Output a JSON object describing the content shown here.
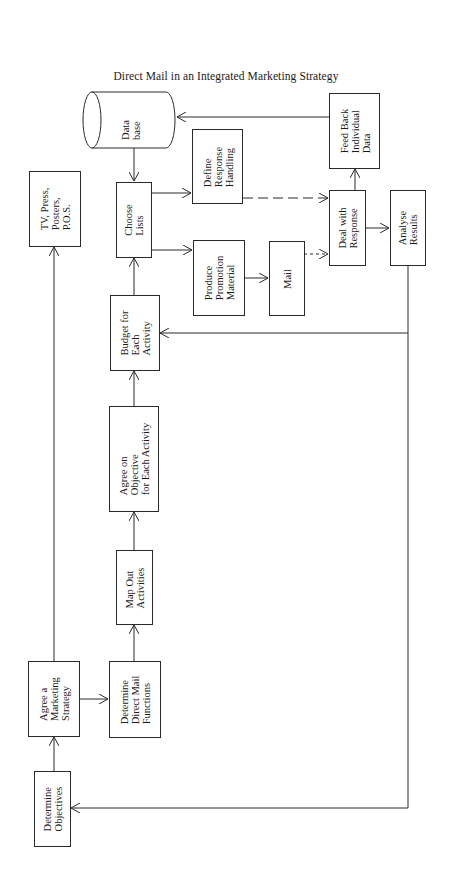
{
  "title": "Direct Mail in an Integrated Marketing Strategy",
  "nodes": {
    "database": "Data\nbase",
    "feed_back": "Feed Back\nIndividual\nData",
    "define_response": "Define\nResponse\nHandling",
    "choose_lists": "Choose\nLists",
    "tv_press": "TV, Press,\nPosters,\nP.O.S.",
    "deal_with_response": "Deal with\nResponse",
    "analyse_results": "Analyse\nResults",
    "produce_promotion": "Produce\nPromotion\nMaterial",
    "mail": "Mail",
    "budget": "Budget for\nEach\nActivity",
    "agree_objective": "Agree on\nObjective\nfor Each Activity",
    "map_out": "Map Out\nActivities",
    "agree_strategy": "Agree a\nMarketing\nStrategy",
    "determine_dm_functions": "Determine\nDirect Mail\nFunctions",
    "determine_objectives": "Determine\nObjectives"
  },
  "edges": [
    {
      "from": "Determine Objectives",
      "to": "Agree a Marketing Strategy",
      "style": "solid"
    },
    {
      "from": "Agree a Marketing Strategy",
      "to": "TV, Press, Posters, P.O.S.",
      "style": "solid"
    },
    {
      "from": "Agree a Marketing Strategy",
      "to": "Determine Direct Mail Functions",
      "style": "solid"
    },
    {
      "from": "Determine Direct Mail Functions",
      "to": "Map Out Activities",
      "style": "solid"
    },
    {
      "from": "Map Out Activities",
      "to": "Agree on Objective for Each Activity",
      "style": "solid"
    },
    {
      "from": "Agree on Objective for Each Activity",
      "to": "Budget for Each Activity",
      "style": "solid"
    },
    {
      "from": "Budget for Each Activity",
      "to": "Choose Lists",
      "style": "solid"
    },
    {
      "from": "Data base",
      "to": "Choose Lists",
      "style": "solid"
    },
    {
      "from": "Choose Lists",
      "to": "Define Response Handling",
      "style": "solid"
    },
    {
      "from": "Choose Lists",
      "to": "Produce Promotion Material",
      "style": "solid"
    },
    {
      "from": "Produce Promotion Material",
      "to": "Mail",
      "style": "solid"
    },
    {
      "from": "Mail",
      "to": "Deal with Response",
      "style": "dashed-short"
    },
    {
      "from": "Define Response Handling",
      "to": "Deal with Response",
      "style": "dashed-long"
    },
    {
      "from": "Deal with Response",
      "to": "Feed Back Individual Data",
      "style": "solid"
    },
    {
      "from": "Feed Back Individual Data",
      "to": "Data base",
      "style": "solid"
    },
    {
      "from": "Deal with Response",
      "to": "Analyse Results",
      "style": "solid"
    },
    {
      "from": "Analyse Results",
      "to": "Budget for Each Activity",
      "style": "solid"
    },
    {
      "from": "Analyse Results",
      "to": "Determine Objectives",
      "style": "solid"
    }
  ],
  "colors": {
    "line": "#2a2a2a",
    "background": "#ffffff"
  }
}
